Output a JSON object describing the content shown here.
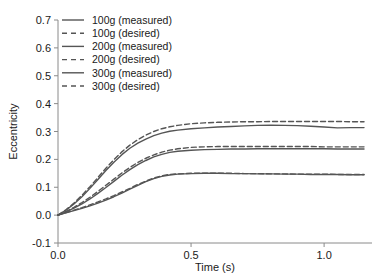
{
  "chart_data": {
    "type": "line",
    "title": "",
    "xlabel": "Time (s)",
    "ylabel": "Eccentricity",
    "xlim": [
      0.0,
      1.18
    ],
    "ylim": [
      -0.1,
      0.7
    ],
    "xticks": [
      0.0,
      0.5,
      1.0
    ],
    "xtick_labels": [
      "0.0",
      "0.5",
      "1.0"
    ],
    "yticks": [
      -0.1,
      0.0,
      0.1,
      0.2,
      0.3,
      0.4,
      0.5,
      0.6,
      0.7
    ],
    "ytick_labels": [
      "-0.1",
      "0.0",
      "0.1",
      "0.2",
      "0.3",
      "0.4",
      "0.5",
      "0.6",
      "0.7"
    ],
    "grid": false,
    "legend_position": "upper-left",
    "line_color": "#555555",
    "axis_color": "#8a8a8a",
    "series": [
      {
        "name": "100g (measured)",
        "style": "solid",
        "x": [
          0.0,
          0.03,
          0.06,
          0.09,
          0.12,
          0.15,
          0.18,
          0.21,
          0.24,
          0.27,
          0.3,
          0.33,
          0.36,
          0.39,
          0.42,
          0.45,
          0.5,
          0.55,
          0.6,
          0.65,
          0.7,
          0.75,
          0.8,
          0.85,
          0.9,
          0.95,
          1.0,
          1.05,
          1.1,
          1.15
        ],
        "y": [
          0.0,
          0.008,
          0.016,
          0.024,
          0.033,
          0.043,
          0.054,
          0.066,
          0.079,
          0.093,
          0.107,
          0.12,
          0.131,
          0.139,
          0.144,
          0.147,
          0.149,
          0.15,
          0.15,
          0.149,
          0.149,
          0.148,
          0.148,
          0.147,
          0.147,
          0.146,
          0.146,
          0.146,
          0.145,
          0.145
        ]
      },
      {
        "name": "100g (desired)",
        "style": "dashed",
        "x": [
          0.0,
          0.03,
          0.06,
          0.09,
          0.12,
          0.15,
          0.18,
          0.21,
          0.24,
          0.27,
          0.3,
          0.33,
          0.36,
          0.39,
          0.42,
          0.45,
          0.5,
          0.55,
          0.6,
          0.65,
          0.7,
          0.75,
          0.8,
          0.85,
          0.9,
          0.95,
          1.0,
          1.05,
          1.1,
          1.15
        ],
        "y": [
          0.0,
          0.009,
          0.018,
          0.027,
          0.037,
          0.047,
          0.058,
          0.07,
          0.083,
          0.096,
          0.11,
          0.122,
          0.133,
          0.141,
          0.146,
          0.148,
          0.15,
          0.15,
          0.15,
          0.15,
          0.149,
          0.149,
          0.148,
          0.148,
          0.147,
          0.147,
          0.147,
          0.146,
          0.146,
          0.146
        ]
      },
      {
        "name": "200g (measured)",
        "style": "solid",
        "x": [
          0.0,
          0.03,
          0.06,
          0.09,
          0.12,
          0.15,
          0.18,
          0.21,
          0.24,
          0.27,
          0.3,
          0.33,
          0.36,
          0.39,
          0.42,
          0.45,
          0.5,
          0.55,
          0.6,
          0.65,
          0.7,
          0.75,
          0.8,
          0.85,
          0.9,
          0.95,
          1.0,
          1.05,
          1.1,
          1.15
        ],
        "y": [
          0.0,
          0.012,
          0.025,
          0.04,
          0.058,
          0.078,
          0.099,
          0.121,
          0.143,
          0.163,
          0.181,
          0.196,
          0.209,
          0.218,
          0.225,
          0.229,
          0.233,
          0.235,
          0.236,
          0.237,
          0.237,
          0.238,
          0.238,
          0.238,
          0.238,
          0.238,
          0.238,
          0.237,
          0.237,
          0.237
        ]
      },
      {
        "name": "200g (desired)",
        "style": "dashed",
        "x": [
          0.0,
          0.03,
          0.06,
          0.09,
          0.12,
          0.15,
          0.18,
          0.21,
          0.24,
          0.27,
          0.3,
          0.33,
          0.36,
          0.39,
          0.42,
          0.45,
          0.5,
          0.55,
          0.6,
          0.65,
          0.7,
          0.75,
          0.8,
          0.85,
          0.9,
          0.95,
          1.0,
          1.05,
          1.1,
          1.15
        ],
        "y": [
          0.0,
          0.013,
          0.028,
          0.045,
          0.064,
          0.085,
          0.107,
          0.129,
          0.151,
          0.171,
          0.189,
          0.204,
          0.216,
          0.226,
          0.233,
          0.238,
          0.243,
          0.245,
          0.246,
          0.246,
          0.246,
          0.246,
          0.246,
          0.246,
          0.246,
          0.246,
          0.245,
          0.245,
          0.245,
          0.245
        ]
      },
      {
        "name": "300g (measured)",
        "style": "solid",
        "x": [
          0.0,
          0.03,
          0.06,
          0.09,
          0.12,
          0.15,
          0.18,
          0.21,
          0.24,
          0.27,
          0.3,
          0.33,
          0.36,
          0.39,
          0.42,
          0.45,
          0.5,
          0.55,
          0.6,
          0.65,
          0.7,
          0.75,
          0.8,
          0.85,
          0.9,
          0.95,
          1.0,
          1.05,
          1.1,
          1.15
        ],
        "y": [
          0.0,
          0.018,
          0.04,
          0.066,
          0.096,
          0.128,
          0.16,
          0.19,
          0.217,
          0.24,
          0.258,
          0.273,
          0.285,
          0.294,
          0.301,
          0.305,
          0.31,
          0.313,
          0.316,
          0.318,
          0.32,
          0.322,
          0.323,
          0.322,
          0.321,
          0.319,
          0.316,
          0.313,
          0.314,
          0.314
        ]
      },
      {
        "name": "300g (desired)",
        "style": "dashed",
        "x": [
          0.0,
          0.03,
          0.06,
          0.09,
          0.12,
          0.15,
          0.18,
          0.21,
          0.24,
          0.27,
          0.3,
          0.33,
          0.36,
          0.39,
          0.42,
          0.45,
          0.5,
          0.55,
          0.6,
          0.65,
          0.7,
          0.75,
          0.8,
          0.85,
          0.9,
          0.95,
          1.0,
          1.05,
          1.1,
          1.15
        ],
        "y": [
          0.0,
          0.019,
          0.043,
          0.071,
          0.102,
          0.135,
          0.168,
          0.199,
          0.227,
          0.251,
          0.271,
          0.287,
          0.3,
          0.31,
          0.317,
          0.322,
          0.328,
          0.331,
          0.333,
          0.334,
          0.335,
          0.335,
          0.336,
          0.336,
          0.336,
          0.336,
          0.336,
          0.336,
          0.335,
          0.335
        ]
      }
    ]
  },
  "legend": {
    "items": [
      {
        "label": "100g (measured)",
        "style": "solid"
      },
      {
        "label": "100g (desired)",
        "style": "dashed"
      },
      {
        "label": "200g (measured)",
        "style": "solid"
      },
      {
        "label": "200g (desired)",
        "style": "dashed"
      },
      {
        "label": "300g (measured)",
        "style": "solid"
      },
      {
        "label": "300g (desired)",
        "style": "dashed"
      }
    ]
  }
}
